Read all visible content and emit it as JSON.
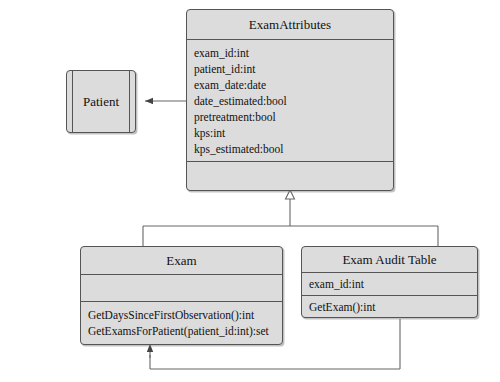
{
  "diagram": {
    "type": "uml-class-diagram",
    "background_color": "#ffffff",
    "box_fill_color": "#dcdcdc",
    "box_border_color": "#555555",
    "line_color": "#555555"
  },
  "classes": {
    "exam_attributes": {
      "name": "ExamAttributes",
      "attributes": [
        "exam_id:int",
        "patient_id:int",
        "exam_date:date",
        "date_estimated:bool",
        "pretreatment:bool",
        "kps:int",
        "kps_estimated:bool"
      ],
      "operations": []
    },
    "patient": {
      "name": "Patient",
      "attributes": [],
      "operations": []
    },
    "exam": {
      "name": "Exam",
      "attributes": [],
      "operations": [
        "GetDaysSinceFirstObservation():int",
        "GetExamsForPatient(patient_id:int):set"
      ]
    },
    "exam_audit_table": {
      "name": "Exam Audit Table",
      "attributes": [
        "exam_id:int"
      ],
      "operations": [
        "GetExam():int"
      ]
    }
  },
  "relationships": [
    {
      "name": "examattributes-to-patient",
      "from": "exam_attributes",
      "to": "patient",
      "arrow": "solid-filled-arrowhead",
      "label": ""
    },
    {
      "name": "exam-generalizes-examattributes",
      "from": "exam",
      "to": "exam_attributes",
      "arrow": "hollow-triangle-generalization",
      "label": ""
    },
    {
      "name": "examaudittable-generalizes-examattributes",
      "from": "exam_audit_table",
      "to": "exam_attributes",
      "arrow": "hollow-triangle-generalization",
      "label": ""
    },
    {
      "name": "examaudittable-to-exam",
      "from": "exam_audit_table",
      "to": "exam",
      "arrow": "solid-filled-arrowhead",
      "label": ""
    }
  ]
}
